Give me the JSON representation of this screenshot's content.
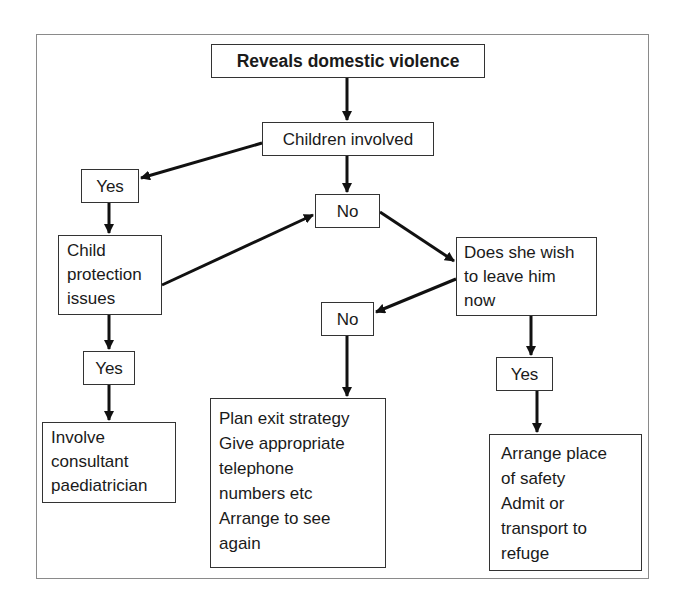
{
  "diagram": {
    "type": "flowchart",
    "nodes": {
      "start": {
        "label": "Reveals domestic violence"
      },
      "children_involved": {
        "label": "Children involved"
      },
      "yes_children": {
        "label": "Yes"
      },
      "child_protection": {
        "label": "Child\nprotection\nissues"
      },
      "yes_protection": {
        "label": "Yes"
      },
      "involve_paediatrician": {
        "label": "Involve\nconsultant\npaediatrician"
      },
      "no_children": {
        "label": "No"
      },
      "wish_to_leave": {
        "label": "Does she wish\nto leave him\nnow"
      },
      "no_leave": {
        "label": "No"
      },
      "plan_exit": {
        "label": "Plan exit strategy\nGive appropriate\ntelephone\nnumbers etc\nArrange to see\nagain"
      },
      "yes_leave": {
        "label": "Yes"
      },
      "place_of_safety": {
        "label": "Arrange place\nof safety\nAdmit or\ntransport to\nrefuge"
      }
    },
    "edges": [
      {
        "from": "start",
        "to": "children_involved"
      },
      {
        "from": "children_involved",
        "to": "yes_children"
      },
      {
        "from": "children_involved",
        "to": "no_children"
      },
      {
        "from": "yes_children",
        "to": "child_protection"
      },
      {
        "from": "child_protection",
        "to": "yes_protection"
      },
      {
        "from": "child_protection",
        "to": "no_children"
      },
      {
        "from": "yes_protection",
        "to": "involve_paediatrician"
      },
      {
        "from": "no_children",
        "to": "wish_to_leave"
      },
      {
        "from": "wish_to_leave",
        "to": "no_leave"
      },
      {
        "from": "wish_to_leave",
        "to": "yes_leave"
      },
      {
        "from": "no_leave",
        "to": "plan_exit"
      },
      {
        "from": "yes_leave",
        "to": "place_of_safety"
      }
    ],
    "colors": {
      "line": "#111111",
      "box_border": "#333333",
      "frame_border": "#8a8a8a",
      "background": "#ffffff"
    }
  }
}
